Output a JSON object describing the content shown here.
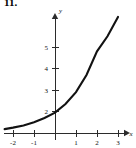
{
  "figure": {
    "problem_number": "11.",
    "background_color": "#ffffff",
    "curve_color": "#121212",
    "axis_color": "#2b2b2b"
  },
  "chart_data": {
    "type": "line",
    "title": "",
    "subtitle": "",
    "xlabel": "x",
    "ylabel": "y",
    "xlim": [
      -2.6,
      3.6
    ],
    "ylim": [
      -0.5,
      5.9
    ],
    "grid": false,
    "legend": null,
    "x_ticks": [
      -2,
      -1,
      1,
      2,
      3
    ],
    "x_tick_labels": [
      "-2",
      "-1",
      "1",
      "2",
      "3"
    ],
    "y_ticks": [
      2,
      3,
      4,
      5
    ],
    "y_tick_labels": [
      "2",
      "3",
      "4",
      "5"
    ],
    "series": [
      {
        "name": "exponential curve",
        "x": [
          -2.4,
          -2,
          -1.5,
          -1,
          -0.5,
          0,
          0.5,
          1,
          1.5,
          2,
          2.5,
          3
        ],
        "values": [
          0.18,
          0.25,
          0.35,
          0.5,
          0.7,
          0.95,
          1.35,
          1.9,
          2.7,
          3.8,
          4.5,
          5.4
        ]
      }
    ],
    "annotations": []
  }
}
